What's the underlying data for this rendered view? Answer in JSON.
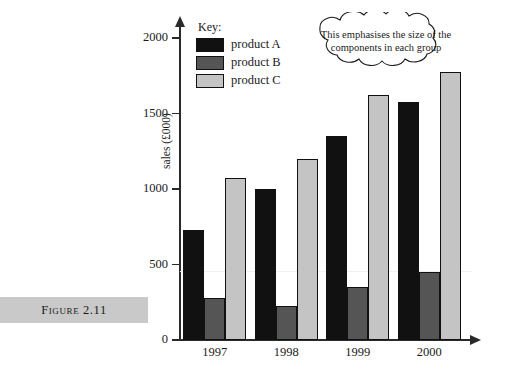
{
  "figure": {
    "caption": "Figure 2.11"
  },
  "chart_data": {
    "type": "bar",
    "title": "",
    "xlabel": "",
    "ylabel": "sales (£000)",
    "categories": [
      "1997",
      "1998",
      "1999",
      "2000"
    ],
    "series": [
      {
        "name": "product A",
        "color": "#111111",
        "values": [
          730,
          1000,
          1350,
          1575
        ]
      },
      {
        "name": "product B",
        "color": "#555555",
        "values": [
          275,
          225,
          350,
          450
        ]
      },
      {
        "name": "product C",
        "color": "#c4c4c4",
        "values": [
          1075,
          1200,
          1620,
          1775
        ]
      }
    ],
    "ylim": [
      0,
      2000
    ],
    "yticks": [
      0,
      500,
      1000,
      1500,
      2000
    ],
    "ytick_labels": [
      "0",
      "500",
      "1000",
      "1500",
      "2000"
    ],
    "grid": false,
    "legend": {
      "position": "top-left",
      "title": "Key:",
      "entries": [
        "product A",
        "product B",
        "product C"
      ]
    },
    "annotations": [
      {
        "name": "cloud-callout",
        "line1": "This emphasises the size of the",
        "line2": "components in each group"
      }
    ]
  }
}
